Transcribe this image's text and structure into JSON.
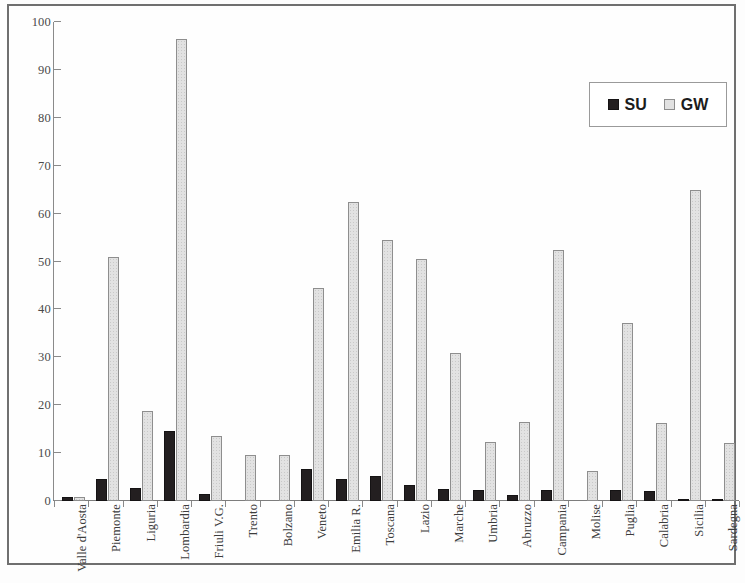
{
  "chart_data": {
    "type": "bar",
    "title": "",
    "subtitle": "",
    "xlabel": "",
    "ylabel": "",
    "ylim": [
      0,
      100
    ],
    "yticks": [
      0,
      10,
      20,
      30,
      40,
      50,
      60,
      70,
      80,
      90,
      100
    ],
    "grid": false,
    "legend_position": "top-right",
    "orientation": "vertical",
    "grouping": "grouped",
    "categories": [
      "Valle d'Aosta",
      "Piemonte",
      "Liguria",
      "Lombardia",
      "Friuli V.G.",
      "Trento",
      "Bolzano",
      "Veneto",
      "Emilia R.",
      "Toscana",
      "Lazio",
      "Marche",
      "Umbria",
      "Abruzzo",
      "Campania",
      "Molise",
      "Puglia",
      "Calabria",
      "Sicilia",
      "Sardegna"
    ],
    "series": [
      {
        "name": "SU",
        "color": "#231f20",
        "values": [
          0.8,
          4.7,
          2.8,
          14.7,
          1.5,
          0.0,
          0.0,
          6.6,
          4.6,
          5.3,
          3.3,
          2.5,
          2.3,
          1.2,
          2.3,
          0.0,
          2.2,
          2.1,
          0.4,
          0.3
        ]
      },
      {
        "name": "GW",
        "color": "#e2e2e2",
        "values": [
          0.8,
          51.0,
          18.8,
          96.5,
          13.5,
          9.7,
          9.6,
          44.5,
          62.5,
          54.5,
          50.5,
          30.8,
          12.4,
          16.5,
          52.3,
          6.2,
          37.2,
          16.3,
          65.0,
          12.1
        ]
      }
    ]
  },
  "legend": {
    "entries": [
      {
        "label": "SU",
        "swatch": "dark-square"
      },
      {
        "label": "GW",
        "swatch": "light-square"
      }
    ]
  }
}
